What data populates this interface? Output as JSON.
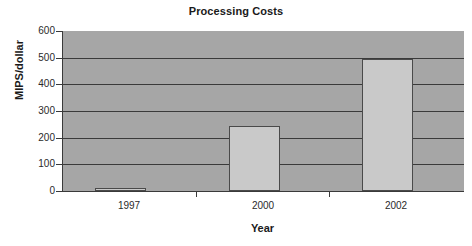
{
  "chart_data": {
    "type": "bar",
    "title": "Processing Costs",
    "xlabel": "Year",
    "ylabel": "MIPS/dollar",
    "categories": [
      "1997",
      "2000",
      "2002"
    ],
    "values": [
      10,
      245,
      495
    ],
    "series": [
      {
        "name": "MIPS/dollar",
        "values": [
          10,
          245,
          495
        ]
      }
    ],
    "ylim": [
      0,
      600
    ],
    "yticks": [
      0,
      100,
      200,
      300,
      400,
      500,
      600
    ],
    "ytick_labels": [
      "0",
      "100",
      "200",
      "300",
      "400",
      "500",
      "600"
    ],
    "grid": true,
    "grid_axis": "y",
    "legend": false,
    "legend_position": "none",
    "colors": {
      "bar_fill": "#c9c9c9",
      "bar_border": "#4a4a4a",
      "plot_background": "#a6a6a6",
      "gridline": "#3a3a3a",
      "axis": "#3a3a3a",
      "text": "#1a1a1a",
      "figure_background": "#ffffff"
    }
  }
}
